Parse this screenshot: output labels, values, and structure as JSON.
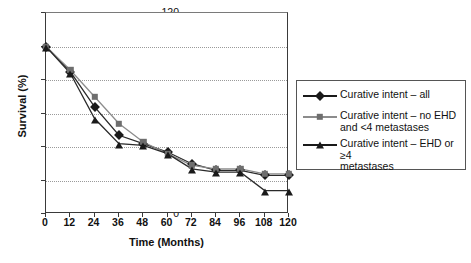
{
  "chart_data": {
    "type": "line",
    "title": "",
    "xlabel": "Time (Months)",
    "ylabel": "Survival (%)",
    "x": [
      0,
      12,
      24,
      36,
      48,
      60,
      72,
      84,
      96,
      108,
      120
    ],
    "categories": [
      "0",
      "12",
      "24",
      "36",
      "48",
      "60",
      "72",
      "84",
      "96",
      "108",
      "120"
    ],
    "xlim": [
      0,
      120
    ],
    "ylim": [
      0,
      120
    ],
    "xticks": [
      0,
      12,
      24,
      36,
      48,
      60,
      72,
      84,
      96,
      108,
      120
    ],
    "yticks": [
      0,
      20,
      40,
      60,
      80,
      100,
      120
    ],
    "grid": "horizontal-dotted",
    "legend_position": "right",
    "series": [
      {
        "name": "Curative intent – all",
        "marker": "diamond",
        "color": "#1a1a1a",
        "values": [
          100,
          85,
          64,
          47,
          42,
          37,
          30,
          26,
          26,
          23,
          23
        ]
      },
      {
        "name": "Curative intent – no EHD and <4 metastases",
        "marker": "square",
        "color": "#6e6e6e",
        "values": [
          100,
          86,
          70,
          54,
          43,
          36,
          29,
          27,
          27,
          24,
          24
        ]
      },
      {
        "name": "Curative intent – EHD or ≥4 metastases",
        "marker": "triangle",
        "color": "#1a1a1a",
        "values": [
          100,
          84,
          57,
          42,
          41,
          36,
          27,
          25,
          25,
          14,
          14
        ]
      }
    ]
  },
  "legend": {
    "entries": [
      {
        "label": "Curative intent – all"
      },
      {
        "label_line1": "Curative intent – no EHD",
        "label_line2": "and <4 metastases"
      },
      {
        "label_line1": "Curative intent – EHD or ≥4",
        "label_line2": "metastases"
      }
    ]
  },
  "axes": {
    "x_title": "Time (Months)",
    "y_title": "Survival (%)",
    "y_ticks": [
      "0",
      "20",
      "40",
      "60",
      "80",
      "100",
      "120"
    ],
    "x_ticks": [
      "0",
      "12",
      "24",
      "36",
      "48",
      "60",
      "72",
      "84",
      "96",
      "108",
      "120"
    ]
  }
}
